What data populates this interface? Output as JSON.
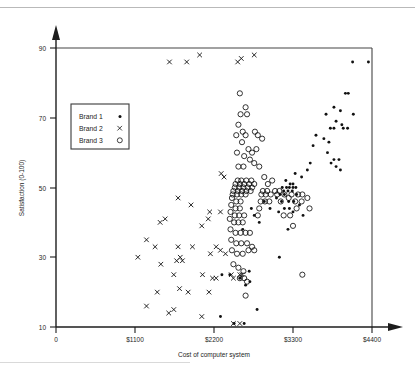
{
  "chart_data": {
    "type": "scatter",
    "title": "",
    "xlabel": "Cost of computer system",
    "ylabel": "Satisfaction (0-100)",
    "xlim": [
      0,
      4400
    ],
    "ylim": [
      10,
      90
    ],
    "xticks": [
      0,
      1100,
      2200,
      3300,
      4400
    ],
    "xticklabels": [
      "0",
      "$1100",
      "$2200",
      "$3300",
      "$4400"
    ],
    "yticks": [
      10,
      30,
      50,
      70,
      90
    ],
    "yticklabels": [
      "10",
      "30",
      "50",
      "70",
      "90"
    ],
    "grid": false,
    "legend_position": "upper-left-inset",
    "series": [
      {
        "name": "Brand 1",
        "marker": "dot",
        "color": "#111111",
        "points": [
          [
            4350,
            86
          ],
          [
            4130,
            86
          ],
          [
            4030,
            77
          ],
          [
            4070,
            77
          ],
          [
            3870,
            73
          ],
          [
            3960,
            72
          ],
          [
            4140,
            71
          ],
          [
            3760,
            71
          ],
          [
            3900,
            69
          ],
          [
            3980,
            68
          ],
          [
            3820,
            67
          ],
          [
            3870,
            67
          ],
          [
            4000,
            67
          ],
          [
            4060,
            67
          ],
          [
            3620,
            65
          ],
          [
            3730,
            64
          ],
          [
            3800,
            63
          ],
          [
            3580,
            62
          ],
          [
            3780,
            60
          ],
          [
            3870,
            58
          ],
          [
            3940,
            58
          ],
          [
            3540,
            57
          ],
          [
            3830,
            57
          ],
          [
            3900,
            56
          ],
          [
            3960,
            55
          ],
          [
            3500,
            55
          ],
          [
            3330,
            54
          ],
          [
            3420,
            53
          ],
          [
            3200,
            52
          ],
          [
            3260,
            51
          ],
          [
            3300,
            51
          ],
          [
            3150,
            50
          ],
          [
            3210,
            50
          ],
          [
            3250,
            50
          ],
          [
            3300,
            50
          ],
          [
            3340,
            50
          ],
          [
            3170,
            49
          ],
          [
            3230,
            49
          ],
          [
            3290,
            49
          ],
          [
            3120,
            48
          ],
          [
            3180,
            48
          ],
          [
            3350,
            48
          ],
          [
            3070,
            47
          ],
          [
            3140,
            46
          ],
          [
            3240,
            46
          ],
          [
            3310,
            46
          ],
          [
            3390,
            45
          ],
          [
            3180,
            44
          ],
          [
            3250,
            44
          ],
          [
            3300,
            43
          ],
          [
            3100,
            43
          ],
          [
            3440,
            42
          ],
          [
            2900,
            46
          ],
          [
            2980,
            44
          ],
          [
            2720,
            44
          ],
          [
            2760,
            42
          ],
          [
            2830,
            40
          ],
          [
            2600,
            38
          ],
          [
            3230,
            38
          ],
          [
            3110,
            30
          ],
          [
            2690,
            26
          ],
          [
            2310,
            25
          ],
          [
            2420,
            25
          ],
          [
            2560,
            24
          ],
          [
            2700,
            23
          ],
          [
            2640,
            22
          ],
          [
            2800,
            15
          ],
          [
            2290,
            13
          ],
          [
            2480,
            11
          ],
          [
            2620,
            11
          ]
        ]
      },
      {
        "name": "Brand 2",
        "marker": "x",
        "color": "#111111",
        "points": [
          [
            1580,
            86
          ],
          [
            1820,
            86
          ],
          [
            2000,
            88
          ],
          [
            2530,
            86
          ],
          [
            2580,
            87
          ],
          [
            2760,
            88
          ],
          [
            2300,
            54
          ],
          [
            2340,
            53
          ],
          [
            1700,
            47
          ],
          [
            1880,
            45
          ],
          [
            2140,
            43
          ],
          [
            2290,
            43
          ],
          [
            1450,
            40
          ],
          [
            1520,
            41
          ],
          [
            2120,
            41
          ],
          [
            2030,
            39
          ],
          [
            1260,
            35
          ],
          [
            1380,
            33
          ],
          [
            1700,
            33
          ],
          [
            1900,
            33
          ],
          [
            2230,
            33
          ],
          [
            2290,
            32
          ],
          [
            2150,
            31
          ],
          [
            2360,
            31
          ],
          [
            1140,
            30
          ],
          [
            1680,
            29
          ],
          [
            1760,
            29
          ],
          [
            1730,
            30
          ],
          [
            1460,
            28
          ],
          [
            1640,
            25
          ],
          [
            2040,
            25
          ],
          [
            2180,
            24
          ],
          [
            2230,
            24
          ],
          [
            2440,
            25
          ],
          [
            2470,
            24
          ],
          [
            2560,
            25
          ],
          [
            2590,
            25
          ],
          [
            1720,
            21
          ],
          [
            1840,
            20
          ],
          [
            1410,
            20
          ],
          [
            2130,
            20
          ],
          [
            1260,
            16
          ],
          [
            1570,
            14
          ],
          [
            1640,
            15
          ],
          [
            2030,
            13
          ],
          [
            2470,
            11
          ],
          [
            2560,
            11
          ]
        ]
      },
      {
        "name": "Brand 3",
        "marker": "circle",
        "color": "#111111",
        "points": [
          [
            2560,
            77
          ],
          [
            2640,
            73
          ],
          [
            2570,
            71
          ],
          [
            2660,
            71
          ],
          [
            2540,
            68
          ],
          [
            2600,
            66
          ],
          [
            2510,
            65
          ],
          [
            2640,
            65
          ],
          [
            2770,
            66
          ],
          [
            2810,
            65
          ],
          [
            2870,
            64
          ],
          [
            2590,
            63
          ],
          [
            2680,
            61
          ],
          [
            2730,
            60
          ],
          [
            2790,
            61
          ],
          [
            2520,
            60
          ],
          [
            2620,
            59
          ],
          [
            2700,
            58
          ],
          [
            2540,
            56
          ],
          [
            2610,
            56
          ],
          [
            2760,
            57
          ],
          [
            2830,
            56
          ],
          [
            2530,
            52
          ],
          [
            2580,
            52
          ],
          [
            2650,
            52
          ],
          [
            2720,
            52
          ],
          [
            2500,
            51
          ],
          [
            2560,
            51
          ],
          [
            2620,
            51
          ],
          [
            2690,
            51
          ],
          [
            2760,
            51
          ],
          [
            2900,
            53
          ],
          [
            2490,
            50
          ],
          [
            2550,
            50
          ],
          [
            2610,
            50
          ],
          [
            2670,
            50
          ],
          [
            2730,
            50
          ],
          [
            2950,
            51
          ],
          [
            3010,
            52
          ],
          [
            2470,
            49
          ],
          [
            2530,
            49
          ],
          [
            2590,
            49
          ],
          [
            2650,
            49
          ],
          [
            2710,
            49
          ],
          [
            2880,
            49
          ],
          [
            2940,
            49
          ],
          [
            3050,
            49
          ],
          [
            3110,
            49
          ],
          [
            2460,
            48
          ],
          [
            2520,
            48
          ],
          [
            2580,
            48
          ],
          [
            2640,
            48
          ],
          [
            2860,
            48
          ],
          [
            2920,
            48
          ],
          [
            2990,
            48
          ],
          [
            3080,
            48
          ],
          [
            3180,
            48
          ],
          [
            3280,
            48
          ],
          [
            3370,
            48
          ],
          [
            3430,
            48
          ],
          [
            2450,
            47
          ],
          [
            2510,
            46
          ],
          [
            2570,
            46
          ],
          [
            2850,
            46
          ],
          [
            2910,
            46
          ],
          [
            2970,
            46
          ],
          [
            3130,
            46
          ],
          [
            3240,
            47
          ],
          [
            3330,
            46
          ],
          [
            3420,
            46
          ],
          [
            3500,
            47
          ],
          [
            2440,
            45
          ],
          [
            2500,
            44
          ],
          [
            2560,
            44
          ],
          [
            2830,
            44
          ],
          [
            3350,
            44
          ],
          [
            3530,
            44
          ],
          [
            2430,
            43
          ],
          [
            2490,
            42
          ],
          [
            2550,
            42
          ],
          [
            2620,
            42
          ],
          [
            2810,
            42
          ],
          [
            3170,
            42
          ],
          [
            3260,
            42
          ],
          [
            2420,
            41
          ],
          [
            2480,
            40
          ],
          [
            2540,
            40
          ],
          [
            2600,
            40
          ],
          [
            3300,
            39
          ],
          [
            2430,
            38
          ],
          [
            2500,
            37
          ],
          [
            2570,
            37
          ],
          [
            2640,
            37
          ],
          [
            2700,
            37
          ],
          [
            2440,
            35
          ],
          [
            2510,
            34
          ],
          [
            2580,
            34
          ],
          [
            2660,
            34
          ],
          [
            2730,
            33
          ],
          [
            2450,
            32
          ],
          [
            2520,
            31
          ],
          [
            2600,
            31
          ],
          [
            2680,
            32
          ],
          [
            2760,
            32
          ],
          [
            2470,
            28
          ],
          [
            2540,
            27
          ],
          [
            2610,
            26
          ],
          [
            2560,
            24
          ],
          [
            2620,
            24
          ],
          [
            2660,
            23
          ],
          [
            3430,
            25
          ],
          [
            2640,
            19
          ]
        ]
      }
    ]
  },
  "legend": {
    "entries": [
      {
        "label": "Brand 1",
        "marker": "dot"
      },
      {
        "label": "Brand 2",
        "marker": "x"
      },
      {
        "label": "Brand 3",
        "marker": "circle"
      }
    ]
  }
}
